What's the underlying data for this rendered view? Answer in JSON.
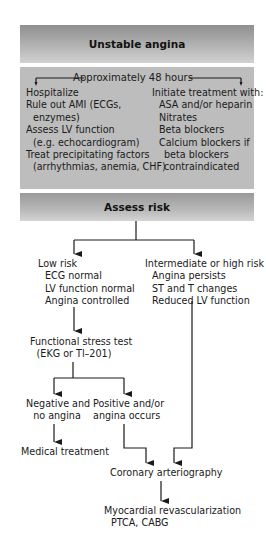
{
  "diagram": {
    "title": "Unstable angina",
    "duration_label": "Approximately 48 hours",
    "initial_actions": {
      "left": [
        {
          "text": "Hospitalize",
          "indent": 0
        },
        {
          "text": "Rule out AMI (ECGs,",
          "indent": 0
        },
        {
          "text": "enzymes)",
          "indent": 2
        },
        {
          "text": "Assess LV function",
          "indent": 0
        },
        {
          "text": "(e.g. echocardiogram)",
          "indent": 2
        },
        {
          "text": "Treat precipitating factors",
          "indent": 0
        },
        {
          "text": "(arrhythmias, anemia, CHF)",
          "indent": 2
        }
      ],
      "right": [
        {
          "text": "Initiate treatment with:",
          "indent": 0
        },
        {
          "text": "ASA and/or heparin",
          "indent": 1
        },
        {
          "text": "Nitrates",
          "indent": 1
        },
        {
          "text": "Beta blockers",
          "indent": 1
        },
        {
          "text": "Calcium blockers if",
          "indent": 1
        },
        {
          "text": "beta blockers",
          "indent": 2
        },
        {
          "text": "contraindicated",
          "indent": 2
        }
      ]
    },
    "assess_label": "Assess risk",
    "low_risk": {
      "heading": "Low risk",
      "items": [
        "ECG normal",
        "LV function normal",
        "Angina controlled"
      ]
    },
    "high_risk": {
      "heading": "Intermediate or high risk",
      "items": [
        "Angina persists",
        "ST and T changes",
        "Reduced LV function"
      ]
    },
    "stress_test": {
      "line1": "Functional stress test",
      "line2": "(EKG or Tl–201)"
    },
    "negative": {
      "line1": "Negative and",
      "line2": "no angina"
    },
    "positive": {
      "line1": "Positive and/or",
      "line2": "angina occurs"
    },
    "medical_treatment": "Medical treatment",
    "arteriography": "Coronary arteriography",
    "revascularization": {
      "line1": "Myocardial revascularization",
      "line2": "PTCA, CABG"
    },
    "colors": {
      "header_gradient_top": "#8f8f8f",
      "header_gradient_bottom": "#d2d2d2",
      "panel_gray": "#bdbdbd",
      "line": "#1a1a1a"
    }
  }
}
